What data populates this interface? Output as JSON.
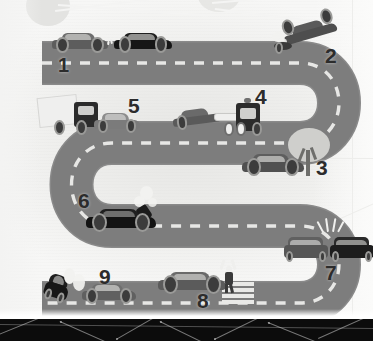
{
  "image": {
    "title": "Road accident scenarios along a winding serpentine road",
    "style": "grayscale flat vector illustration",
    "width": 373,
    "height": 341
  },
  "palette": {
    "background": "#eeeeec",
    "road": "#7d7d7d",
    "road_edge": "#8a8a8a",
    "lane_dash": "#ededeb",
    "vehicle_dark": "#2a2a2a",
    "vehicle_mid": "#616161",
    "vehicle_light": "#8e8e8e",
    "label_text": "#2c2c2c",
    "bottom_band": "#0c0c0c"
  },
  "road": {
    "name": "serpentine-road",
    "shape": "S-curve / snake road with three horizontal straights joined by two U-turns",
    "lane_marking": "dashed center line",
    "straights": [
      "top-straight",
      "middle-straight",
      "bottom-straight"
    ],
    "curves": [
      "right-u-turn",
      "left-u-turn",
      "right-u-turn-lower"
    ]
  },
  "scenes": [
    {
      "number": "1",
      "name": "rear-end-collision",
      "label": "1",
      "description": "Two cars rear-end collision on the top straight",
      "vehicles": 2
    },
    {
      "number": "2",
      "name": "rollover-off-road",
      "label": "2",
      "description": "Overturned car off the road at the top right curve",
      "vehicles": 1
    },
    {
      "number": "3",
      "name": "collision-with-tree",
      "label": "3",
      "description": "Car crashed into a roadside tree",
      "vehicles": 1
    },
    {
      "number": "4",
      "name": "tow-truck-recovery",
      "label": "4",
      "description": "Tow truck towing a damaged car",
      "vehicles": 2
    },
    {
      "number": "5",
      "name": "truck-car-collision",
      "label": "5",
      "description": "Box truck collides with a car",
      "vehicles": 2
    },
    {
      "number": "6",
      "name": "engine-breakdown",
      "label": "6",
      "description": "Car with open hood and smoke from the engine",
      "vehicles": 1
    },
    {
      "number": "7",
      "name": "head-on-collision",
      "label": "7",
      "description": "Head-on collision between two cars on the lower right curve",
      "vehicles": 2
    },
    {
      "number": "8",
      "name": "pedestrian-struck-at-crosswalk",
      "label": "8",
      "description": "Car striking a pedestrian beside a zebra crossing",
      "vehicles": 1
    },
    {
      "number": "9",
      "name": "overturned-vehicle",
      "label": "9",
      "description": "Overturned vehicle next to a car on the bottom straight",
      "vehicles": 2
    }
  ],
  "labels": {
    "n1": "1",
    "n2": "2",
    "n3": "3",
    "n4": "4",
    "n5": "5",
    "n6": "6",
    "n7": "7",
    "n8": "8",
    "n9": "9"
  },
  "decor": {
    "bottom_band": "dark footer strip with thin white polygon network lines",
    "watermark": "faint light grey blobs and radiating lines behind the illustration"
  }
}
